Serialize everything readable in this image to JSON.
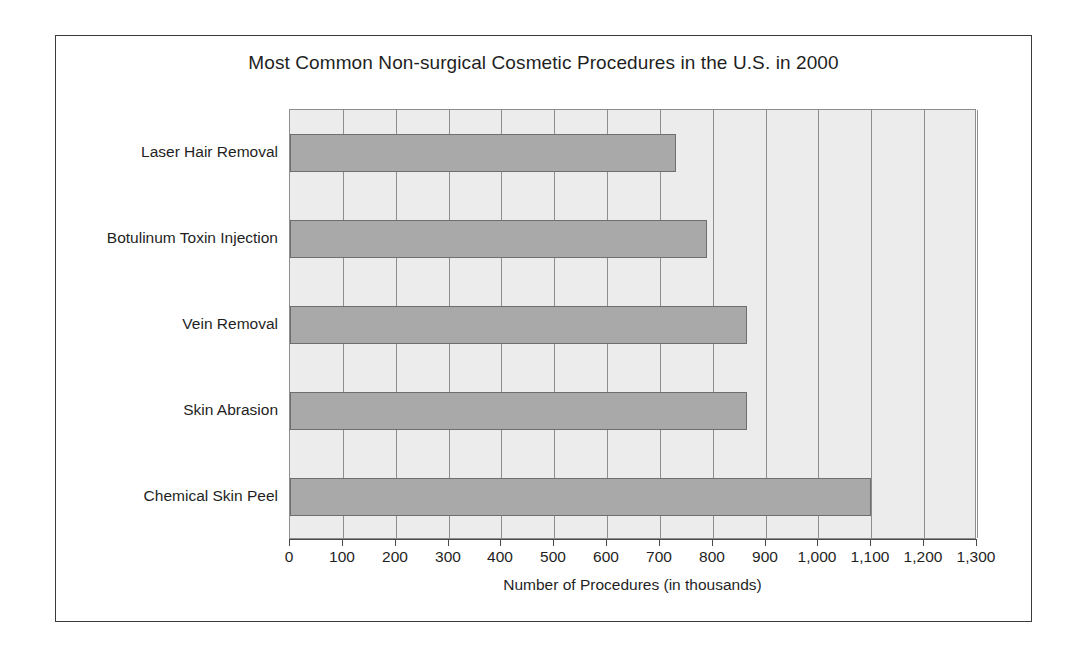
{
  "chart_data": {
    "type": "bar",
    "orientation": "horizontal",
    "title": "Most Common Non-surgical Cosmetic Procedures in the U.S. in 2000",
    "xlabel": "Number of Procedures (in thousands)",
    "ylabel": "",
    "categories": [
      "Laser Hair Removal",
      "Botulinum Toxin Injection",
      "Vein Removal",
      "Skin Abrasion",
      "Chemical Skin Peel"
    ],
    "values": [
      730,
      790,
      865,
      865,
      1100
    ],
    "xlim": [
      0,
      1300
    ],
    "xticks": [
      0,
      100,
      200,
      300,
      400,
      500,
      600,
      700,
      800,
      900,
      1000,
      1100,
      1200,
      1300
    ],
    "xtick_labels": [
      "0",
      "100",
      "200",
      "300",
      "400",
      "500",
      "600",
      "700",
      "800",
      "900",
      "1,000",
      "1,100",
      "1,200",
      "1,300"
    ],
    "grid": true,
    "grid_axis": "x",
    "legend": false,
    "colors": {
      "bar_fill": "#a9a9a9",
      "bar_stroke": "#6e6e6e",
      "plot_background": "#ececec",
      "gridline": "#8d8d8d",
      "frame": "#3b3b3b",
      "text": "#1f1f1f"
    }
  }
}
